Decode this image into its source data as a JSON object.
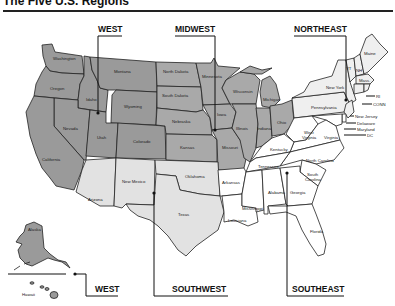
{
  "header": {
    "title": "The Five U.S. Regions"
  },
  "regions": {
    "west": "WEST",
    "midwest": "MIDWEST",
    "northeast": "NORTHEAST",
    "southwest": "SOUTHWEST",
    "southeast": "SOUTHEAST",
    "west_inset": "WEST"
  },
  "colors": {
    "west": "#9a9a9a",
    "midwest": "#a9a9a9",
    "southwest": "#e2e2e2",
    "northeast": "#efefef",
    "southeast": "#ffffff"
  },
  "states": {
    "washington": "Washington",
    "oregon": "Oregon",
    "idaho": "Idaho",
    "montana": "Montana",
    "wyoming": "Wyoming",
    "nevada": "Nevada",
    "utah": "Utah",
    "colorado": "Colorado",
    "california": "California",
    "alaska": "Alaska",
    "hawaii": "Hawaii",
    "north_dakota": "North Dakota",
    "south_dakota": "South Dakota",
    "nebraska": "Nebraska",
    "kansas": "Kansas",
    "minnesota": "Minnesota",
    "iowa": "Iowa",
    "missouri": "Missouri",
    "wisconsin": "Wisconsin",
    "illinois": "Illinois",
    "indiana": "Indiana",
    "michigan": "Michigan",
    "ohio": "Ohio",
    "arizona": "Arizona",
    "new_mexico": "New Mexico",
    "oklahoma": "Oklahoma",
    "texas": "Texas",
    "maine": "Maine",
    "vermont": "VT",
    "new_hampshire": "NH",
    "massachusetts": "Mass.",
    "rhode_island": "RI",
    "connecticut": "CONN",
    "new_york": "New York",
    "pennsylvania": "Pennsylvania",
    "new_jersey": "New Jersey",
    "delaware": "Delaware",
    "maryland": "Maryland",
    "dc": "DC",
    "west_virginia_1": "West",
    "west_virginia_2": "Virginia",
    "virginia": "Virginia",
    "kentucky": "Kentucky",
    "tennessee": "Tennessee",
    "north_carolina": "North Carolina",
    "south_carolina_1": "South",
    "south_carolina_2": "Carolina",
    "arkansas": "Arkansas",
    "louisiana": "Louisiana",
    "mississippi": "Mississippi",
    "alabama": "Alabama",
    "georgia": "Georgia",
    "florida": "Florida"
  }
}
